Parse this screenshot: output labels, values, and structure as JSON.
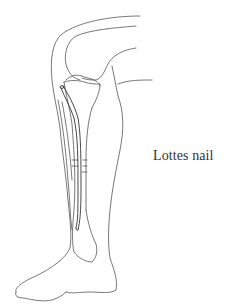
{
  "figure": {
    "label": "Lottes nail",
    "line_color": "#555555",
    "background": "#ffffff"
  }
}
